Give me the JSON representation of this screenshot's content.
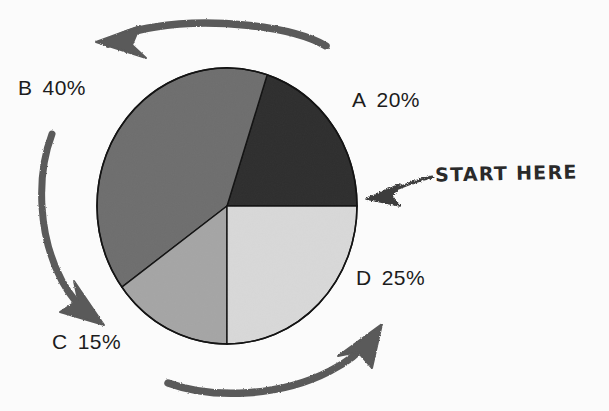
{
  "figure": {
    "background_color": "#fbfbfb",
    "ink_color": "#4f4f4f",
    "outline_color": "#1a1a1a"
  },
  "annotation": {
    "start_here_label": "START HERE",
    "start_here_arrow": "arrow-pointing-left-at-pie-boundary",
    "flow_direction": "counter-clockwise",
    "cycle_arrows": [
      {
        "name": "top-arrow",
        "direction": "right-to-left"
      },
      {
        "name": "left-arrow",
        "direction": "top-to-bottom"
      },
      {
        "name": "bottom-arrow",
        "direction": "left-to-right"
      }
    ]
  },
  "labels": {
    "a": {
      "key": "A",
      "value": "20%"
    },
    "b": {
      "key": "B",
      "value": "40%"
    },
    "c": {
      "key": "C",
      "value": "15%"
    },
    "d": {
      "key": "D",
      "value": "25%"
    }
  },
  "chart_data": {
    "type": "pie",
    "title": "",
    "categories": [
      "A",
      "B",
      "C",
      "D"
    ],
    "values": [
      20,
      40,
      15,
      25
    ],
    "value_labels": [
      "20%",
      "40%",
      "15%",
      "25%"
    ],
    "unit": "%",
    "total": 100,
    "start_angle_deg": 0,
    "start_angle_description": "3 o'clock position, labeled START HERE",
    "direction": "counterclockwise",
    "legend": "none",
    "grid": false,
    "colors": [
      "#2e2e2e",
      "#6e6e6e",
      "#a5a5a5",
      "#d8d8d8"
    ],
    "slice_angles_deg": [
      72,
      144,
      54,
      90
    ],
    "annotations": [
      "START HERE"
    ],
    "geometry": {
      "center_x": 227,
      "center_y": 206,
      "radius_x": 130,
      "radius_y": 138
    }
  }
}
